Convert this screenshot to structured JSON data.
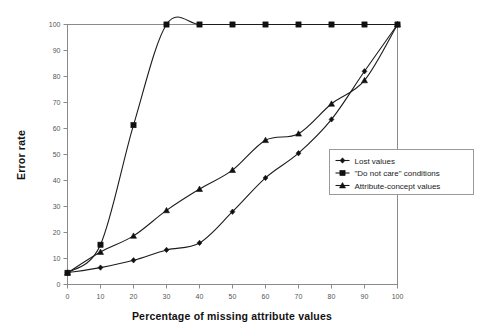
{
  "chart_data": {
    "type": "line",
    "title": "",
    "xlabel": "Percentage of missing attribute values",
    "ylabel": "Error rate",
    "x": [
      0,
      10,
      20,
      30,
      40,
      50,
      60,
      70,
      80,
      90,
      100
    ],
    "xlim": [
      0,
      100
    ],
    "ylim": [
      0,
      100
    ],
    "xticks": [
      "0",
      "10",
      "20",
      "30",
      "40",
      "50",
      "60",
      "70",
      "80",
      "90",
      "100"
    ],
    "yticks": [
      "0",
      "10",
      "20",
      "30",
      "40",
      "50",
      "60",
      "70",
      "80",
      "90",
      "100"
    ],
    "grid": false,
    "legend_position": "center-right",
    "smoothed": true,
    "series": [
      {
        "name": "Lost values",
        "marker": "diamond",
        "values": [
          4.5,
          6.5,
          9.3,
          13.3,
          16.0,
          28.0,
          41.0,
          50.5,
          63.5,
          82.0,
          100.0
        ]
      },
      {
        "name": "\"Do not care\" conditions",
        "marker": "square",
        "values": [
          4.5,
          15.3,
          61.3,
          100.0,
          100.0,
          100.0,
          100.0,
          100.0,
          100.0,
          100.0,
          100.0
        ]
      },
      {
        "name": "Attribute-concept values",
        "marker": "triangle",
        "values": [
          4.5,
          12.5,
          18.7,
          28.5,
          36.7,
          44.0,
          55.5,
          58.0,
          69.5,
          78.5,
          100.0
        ]
      }
    ],
    "colors": {
      "line": "#1c1c1c",
      "marker": "#111111",
      "frame": "#8a8a8a",
      "background": "#ffffff",
      "tick_text": "#555555",
      "axis_title_text": "#111111"
    }
  },
  "legend": {
    "entries": [
      {
        "label": "Lost values"
      },
      {
        "label": "\"Do not care\" conditions"
      },
      {
        "label": "Attribute-concept values"
      }
    ]
  }
}
